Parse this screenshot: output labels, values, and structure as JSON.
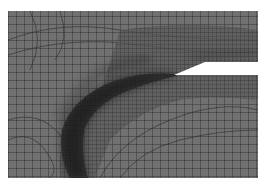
{
  "figure": {
    "colors": {
      "background": "#ffffff",
      "mesh_fill": "#707070",
      "mesh_line": "#2b2b2b",
      "refined_band": "#1e1e1e",
      "notch": "#ffffff"
    },
    "mesh_bounds": {
      "x": 8,
      "y": 11,
      "width": 250,
      "height": 167
    },
    "notch": {
      "tip_x": 174,
      "tip_y": 75,
      "top_y": 62,
      "bottom_y": 75,
      "slope_end_x": 205
    },
    "coarse_spacing": 8,
    "fine_spacing": 4
  }
}
